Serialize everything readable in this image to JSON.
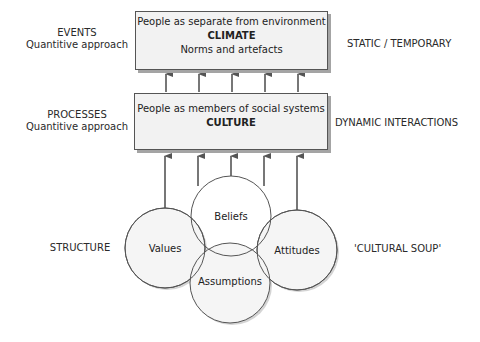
{
  "diagram": {
    "climate_box": {
      "line1": "People as separate from environment",
      "title": "CLIMATE",
      "line3": "Norms and artefacts"
    },
    "culture_box": {
      "line1": "People as members of social systems",
      "title": "CULTURE"
    },
    "left_labels": {
      "events": {
        "line1": "EVENTS",
        "line2": "Quantitive approach"
      },
      "processes": {
        "line1": "PROCESSES",
        "line2": "Quantitive approach"
      },
      "structure": "STRUCTURE"
    },
    "right_labels": {
      "static": "STATIC / TEMPORARY",
      "dynamic": "DYNAMIC INTERACTIONS",
      "soup": "'CULTURAL SOUP'"
    },
    "circles": [
      {
        "label": "Values",
        "cx": 165,
        "cy": 248,
        "r": 40
      },
      {
        "label": "Beliefs",
        "cx": 231,
        "cy": 216,
        "r": 40
      },
      {
        "label": "Attitudes",
        "cx": 297,
        "cy": 250,
        "r": 40
      },
      {
        "label": "Assumptions",
        "cx": 230,
        "cy": 283,
        "r": 40
      }
    ],
    "arrows_count_per_level": 5,
    "colors": {
      "box_fill": "#f2f2f2",
      "border": "#555555",
      "shadow": "#a4a4a4",
      "arrow": "#555555",
      "circle_fill": "#f5f5f5"
    }
  }
}
